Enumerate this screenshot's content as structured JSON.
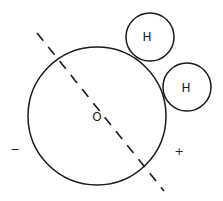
{
  "diagram": {
    "oxygen": {
      "label": "O"
    },
    "hydrogens": [
      {
        "label": "H"
      },
      {
        "label": "H"
      }
    ],
    "charges": {
      "negative": "−",
      "positive": "+"
    },
    "stroke_color": "#1a1a1a"
  }
}
